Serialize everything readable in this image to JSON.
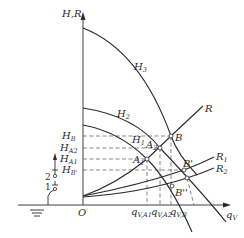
{
  "diagram": {
    "type": "pump-system operating point diagram",
    "axes": {
      "y_label": "H,R",
      "x_label": "q",
      "x_label_sub": "V",
      "origin_label": "O"
    },
    "curves": {
      "pump_curves": [
        {
          "label": "H",
          "sub": "3"
        },
        {
          "label": "H",
          "sub": "2"
        },
        {
          "label": "H",
          "sub": "1"
        }
      ],
      "system_curves": [
        {
          "label": "R",
          "sub": ""
        },
        {
          "label": "R",
          "sub": "1"
        },
        {
          "label": "R",
          "sub": "2"
        }
      ]
    },
    "points": [
      {
        "label": "A",
        "sub": "1"
      },
      {
        "label": "A",
        "sub": "2"
      },
      {
        "label": "B",
        "sub": ""
      },
      {
        "label": "B'",
        "sub": ""
      },
      {
        "label": "B''",
        "sub": ""
      }
    ],
    "y_ticks": [
      {
        "label": "H",
        "sub": "B"
      },
      {
        "label": "H",
        "sub": "A2"
      },
      {
        "label": "H",
        "sub": "A1"
      },
      {
        "label": "H",
        "sub": "B'"
      }
    ],
    "x_ticks": [
      {
        "label": "q",
        "sub": "V,A1"
      },
      {
        "label": "q",
        "sub": "V,A2"
      },
      {
        "label": "q",
        "sub": "V,B"
      }
    ],
    "valve_symbol": {
      "label_1": "1",
      "label_2": "2"
    }
  }
}
